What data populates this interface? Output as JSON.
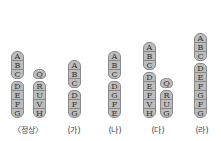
{
  "figure": {
    "panels": [
      {
        "label": "〈정상〉",
        "chromosomes": [
          {
            "genes": [
              "A",
              "B",
              "C",
              "D",
              "E",
              "F",
              "G"
            ],
            "centromere_after": 3
          },
          {
            "genes": [
              "Q",
              "R",
              "U",
              "V",
              "H"
            ],
            "centromere_after": 1
          }
        ]
      },
      {
        "label": "(가)",
        "chromosomes": [
          {
            "genes": [
              "A",
              "B",
              "C",
              "D",
              "F",
              "G"
            ],
            "centromere_after": 3
          }
        ]
      },
      {
        "label": "(나)",
        "chromosomes": [
          {
            "genes": [
              "A",
              "B",
              "C",
              "D",
              "G",
              "F",
              "E"
            ],
            "centromere_after": 3
          }
        ]
      },
      {
        "label": "(다)",
        "chromosomes": [
          {
            "genes": [
              "A",
              "B",
              "C",
              "D",
              "E",
              "F",
              "V",
              "H"
            ],
            "centromere_after": 3
          },
          {
            "genes": [
              "Q",
              "R",
              "U",
              "G"
            ],
            "centromere_after": 1
          }
        ]
      },
      {
        "label": "(라)",
        "chromosomes": [
          {
            "genes": [
              "A",
              "B",
              "C",
              "D",
              "E",
              "F",
              "G",
              "F",
              "G"
            ],
            "centromere_after": 3
          }
        ]
      }
    ]
  }
}
